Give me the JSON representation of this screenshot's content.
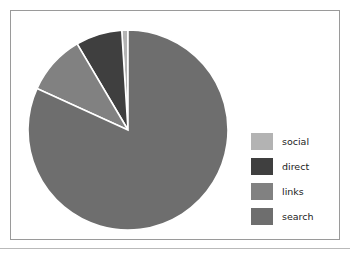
{
  "figure": {
    "frame_border_color": "#9a9a9a",
    "background_color": "#ffffff",
    "separator_color": "#b9b9b9",
    "slice_edge_color": "#ffffff"
  },
  "legend": {
    "position": "right",
    "entries": [
      {
        "label": "social",
        "color": "#b3b3b3"
      },
      {
        "label": "direct",
        "color": "#3f3f3f"
      },
      {
        "label": "links",
        "color": "#818181"
      },
      {
        "label": "search",
        "color": "#6e6e6e"
      }
    ]
  },
  "chart_data": {
    "type": "pie",
    "title": "",
    "subtitle": "",
    "xlabel": "",
    "ylabel": "",
    "categories": [
      "social",
      "direct",
      "links",
      "search"
    ],
    "values": [
      1.0,
      7.5,
      9.7,
      81.8
    ],
    "units": "percent",
    "colors": [
      "#b3b3b3",
      "#3f3f3f",
      "#818181",
      "#6e6e6e"
    ],
    "legend_entries": [
      "social",
      "direct",
      "links",
      "search"
    ],
    "legend_position": "right",
    "grid": false,
    "start_angle_deg": 90,
    "direction": "counterclockwise",
    "center": {
      "cx": 100,
      "cy": 100
    },
    "radius": 100,
    "annotations": []
  }
}
